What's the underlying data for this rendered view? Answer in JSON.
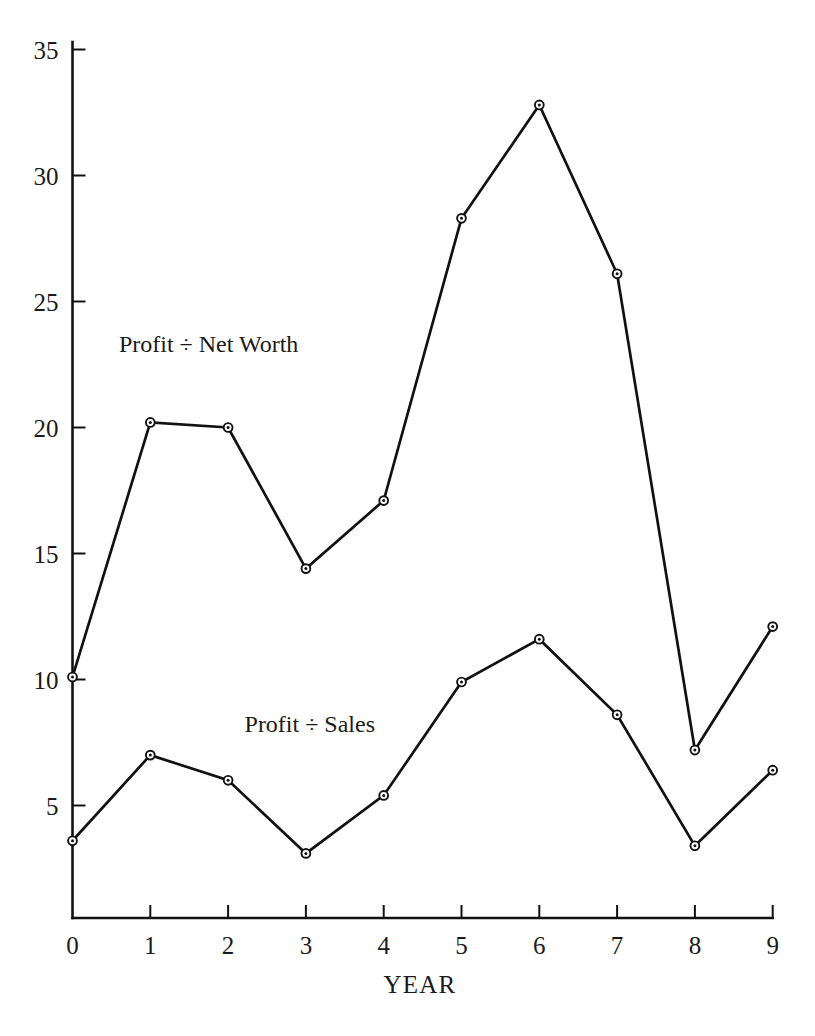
{
  "chart_data": {
    "type": "line",
    "title": "",
    "xlabel": "YEAR",
    "ylabel": "",
    "x": [
      0,
      1,
      2,
      3,
      4,
      5,
      6,
      7,
      8,
      9
    ],
    "categories": [
      "0",
      "1",
      "2",
      "3",
      "4",
      "5",
      "6",
      "7",
      "8",
      "9"
    ],
    "xlim": [
      0,
      9
    ],
    "ylim": [
      0,
      35
    ],
    "grid": false,
    "legend_position": "inline-annotation",
    "xticks": [
      0,
      1,
      2,
      3,
      4,
      5,
      6,
      7,
      8,
      9
    ],
    "xtick_labels": [
      "0",
      "1",
      "2",
      "3",
      "4",
      "5",
      "6",
      "7",
      "8",
      "9"
    ],
    "yticks": [
      5,
      10,
      15,
      20,
      25,
      30,
      35
    ],
    "ytick_labels": [
      "5",
      "10",
      "15",
      "20",
      "25",
      "30",
      "35"
    ],
    "marker": "circle-with-center-dot",
    "series": [
      {
        "name": "Profit ÷ Net Worth",
        "values": [
          10.1,
          20.2,
          20.0,
          14.4,
          17.1,
          28.3,
          32.8,
          26.1,
          7.2,
          12.1
        ],
        "annotation": "Profit ÷ Net Worth",
        "color": "#111111"
      },
      {
        "name": "Profit ÷ Sales",
        "values": [
          3.6,
          7.0,
          6.0,
          3.1,
          5.4,
          9.9,
          11.6,
          8.6,
          3.4,
          6.4
        ],
        "annotation": "Profit ÷ Sales",
        "color": "#111111"
      }
    ],
    "annotations": [
      {
        "text": "Profit ÷ Net Worth",
        "x": 1.75,
        "y": 23.0
      },
      {
        "text": "Profit ÷ Sales",
        "x": 3.05,
        "y": 7.9
      }
    ]
  },
  "axes": {
    "x_axis_title": "YEAR",
    "y_axis_title": ""
  }
}
